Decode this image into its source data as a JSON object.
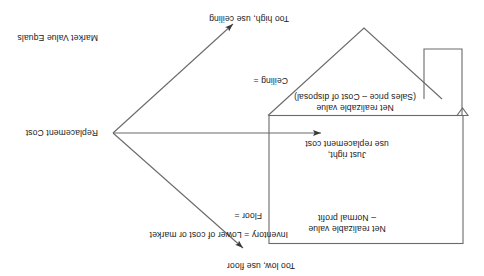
{
  "diagram": {
    "title": "Inventory = Lower of cost or market",
    "orientation": "rotated-180",
    "nodes": {
      "replacement_cost": "Replacement Cost",
      "market_value_equals": "Market Value Equals"
    },
    "bounds": {
      "ceiling_label": "Ceiling =",
      "ceiling_value": "Net realizable value\n(Sales price – Cost of disposal)",
      "floor_label": "Floor =",
      "floor_value": "Net realizable value\n– Normal profit"
    },
    "outcomes": {
      "too_low": "Too low, use floor",
      "just_right": "Just right,\nuse replacement cost",
      "too_high": "Too high, use ceiling"
    },
    "colors": {
      "stroke": "#5a5a5a",
      "text": "#1a1a1a",
      "background": "#ffffff"
    }
  }
}
